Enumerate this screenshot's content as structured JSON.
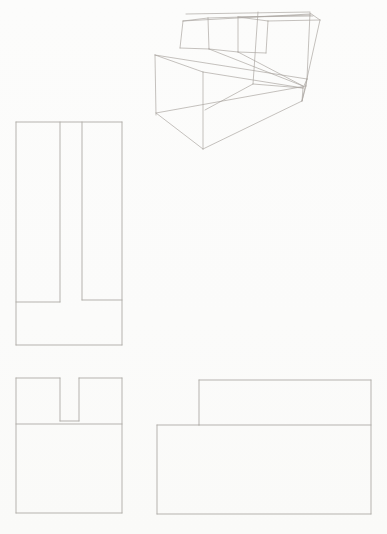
{
  "drawing": {
    "description": "pencil sketch exercise: wireframe pictorial of a slotted step block with three orthographic projection views",
    "background": "#fbfbfa",
    "canvas": {
      "width": 387,
      "height": 534
    },
    "views": [
      {
        "id": "pictorial",
        "name": "pictorial-wireframe-view",
        "stroke": "#a9a59f",
        "stroke_width": 0.8,
        "opacity": 0.85,
        "segments": [
          [
            155,
            55,
            203,
            72
          ],
          [
            155,
            55,
            156,
            115
          ],
          [
            203,
            72,
            203,
            149
          ],
          [
            156,
            113,
            203,
            149
          ],
          [
            203,
            149,
            302,
            101
          ],
          [
            156,
            113,
            306,
            86
          ],
          [
            203,
            72,
            303,
            88
          ],
          [
            155,
            55,
            307,
            79
          ],
          [
            303,
            88,
            302,
            101
          ],
          [
            307,
            79,
            306,
            86
          ],
          [
            303,
            88,
            307,
            79
          ],
          [
            302,
            101,
            306,
            86
          ],
          [
            183,
            21,
            208,
            18
          ],
          [
            183,
            21,
            180,
            48
          ],
          [
            180,
            48,
            209,
            49
          ],
          [
            208,
            18,
            209,
            49
          ],
          [
            209,
            49,
            238,
            52
          ],
          [
            238,
            17,
            238,
            52
          ],
          [
            238,
            17,
            268,
            21
          ],
          [
            268,
            21,
            266,
            53
          ],
          [
            238,
            52,
            266,
            53
          ],
          [
            186,
            14,
            310,
            12
          ],
          [
            183,
            21,
            310,
            14
          ],
          [
            208,
            18,
            311,
            15
          ],
          [
            238,
            17,
            313,
            16
          ],
          [
            268,
            21,
            320,
            20
          ],
          [
            320,
            20,
            302,
            101
          ],
          [
            310,
            13,
            307,
            79
          ],
          [
            310,
            13,
            320,
            20
          ],
          [
            258,
            12,
            253,
            84
          ],
          [
            253,
            84,
            205,
            110
          ],
          [
            253,
            84,
            303,
            88
          ],
          [
            209,
            49,
            303,
            86
          ],
          [
            238,
            52,
            303,
            86
          ]
        ]
      },
      {
        "id": "top-view",
        "name": "top-projection-view",
        "stroke": "#aeaba6",
        "stroke_width": 1,
        "opacity": 0.9,
        "segments": [
          [
            16,
            122,
            122,
            122
          ],
          [
            122,
            122,
            122,
            345
          ],
          [
            122,
            345,
            16,
            345
          ],
          [
            16,
            345,
            16,
            122
          ],
          [
            60,
            122,
            60,
            302
          ],
          [
            82,
            122,
            82,
            300
          ],
          [
            16,
            302,
            60,
            302
          ],
          [
            82,
            300,
            122,
            300
          ]
        ]
      },
      {
        "id": "front-view",
        "name": "front-projection-view",
        "stroke": "#aeaba6",
        "stroke_width": 1,
        "opacity": 0.9,
        "segments": [
          [
            16,
            378,
            60,
            378
          ],
          [
            79,
            378,
            122,
            378
          ],
          [
            60,
            378,
            60,
            421
          ],
          [
            79,
            378,
            79,
            421
          ],
          [
            60,
            421,
            79,
            421
          ],
          [
            16,
            424,
            122,
            424
          ],
          [
            16,
            378,
            16,
            513
          ],
          [
            122,
            378,
            122,
            513
          ],
          [
            16,
            513,
            122,
            513
          ]
        ]
      },
      {
        "id": "side-view",
        "name": "side-projection-view",
        "stroke": "#aeaba6",
        "stroke_width": 1,
        "opacity": 0.9,
        "segments": [
          [
            199,
            380,
            371,
            380
          ],
          [
            371,
            380,
            371,
            514
          ],
          [
            371,
            514,
            157,
            514
          ],
          [
            157,
            514,
            157,
            425
          ],
          [
            157,
            425,
            199,
            425
          ],
          [
            199,
            425,
            199,
            380
          ],
          [
            199,
            425,
            371,
            425
          ]
        ]
      }
    ]
  }
}
